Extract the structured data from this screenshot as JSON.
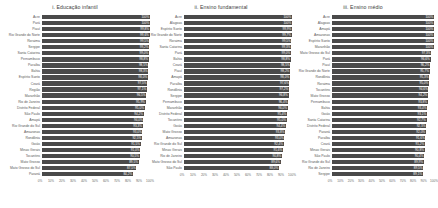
{
  "figure": {
    "background": "#ffffff",
    "bar_color": "#4a4a4a",
    "value_label_color": "#ffffff",
    "axis_text_color": "#6a6a6a"
  },
  "axis": {
    "ticks": [
      "0%",
      "10%",
      "20%",
      "30%",
      "40%",
      "50%",
      "60%",
      "70%",
      "80%",
      "90%",
      "100%"
    ],
    "min": 0,
    "max": 100
  },
  "chart_data": [
    {
      "type": "bar",
      "orientation": "horizontal",
      "title": "i. Educação infantil",
      "xlabel": "",
      "ylabel": "",
      "xlim": [
        0,
        100
      ],
      "grid": false,
      "legend": "none",
      "categories": [
        "Acre",
        "Pará",
        "Piauí",
        "Rio Grande do Norte",
        "Roraima",
        "Sergipe",
        "Santa Catarina",
        "Pernambuco",
        "Paraíba",
        "Bahia",
        "Espírito Santo",
        "Ceará",
        "Região",
        "Maranhão",
        "Rio de Janeiro",
        "Distrito Federal",
        "São Paulo",
        "Amapá",
        "Rio Grande do Sul",
        "Amazonas",
        "Rondônia",
        "Goiás",
        "Minas Gerais",
        "Tocantins",
        "Mato Grosso",
        "Mato Grosso do Sul",
        "Paraná"
      ],
      "values": [
        100.0,
        100.0,
        99.8,
        99.6,
        99.5,
        99.2,
        99.0,
        98.8,
        98.5,
        98.3,
        98.0,
        97.5,
        97.1,
        96.5,
        95.9,
        95.0,
        94.2,
        94.0,
        93.3,
        93.0,
        92.5,
        91.5,
        91.0,
        90.5,
        89.5,
        87.5,
        84.2
      ],
      "value_labels": [
        "100%",
        "100%",
        "99,8%",
        "99,6%",
        "99,5%",
        "99,2%",
        "99,0%",
        "98,8%",
        "98,5%",
        "98,3%",
        "98,0%",
        "97,5%",
        "97,1%",
        "96,5%",
        "95,9%",
        "95,0%",
        "94,2%",
        "94,0%",
        "93,3%",
        "93,0%",
        "92,5%",
        "91,5%",
        "91,0%",
        "90,5%",
        "89,5%",
        "87,5%",
        "84,2%"
      ]
    },
    {
      "type": "bar",
      "orientation": "horizontal",
      "title": "ii. Ensino fundamental",
      "xlabel": "",
      "ylabel": "",
      "xlim": [
        0,
        100
      ],
      "grid": false,
      "legend": "none",
      "categories": [
        "Acre",
        "Alagoas",
        "Espírito Santo",
        "Rio Grande do Norte",
        "Roraima",
        "Santa Catarina",
        "Pará",
        "Bahia",
        "Ceará",
        "Piauí",
        "Amapá",
        "Paraíba",
        "Rondônia",
        "Sergipe",
        "Pernambuco",
        "Maranhão",
        "Distrito Federal",
        "Tocantins",
        "Goiás",
        "Mato Grosso",
        "Amazonas",
        "Rio Grande do Sul",
        "Minas Gerais",
        "Rio de Janeiro",
        "Mato Grosso do Sul",
        "São Paulo"
      ],
      "values": [
        100.0,
        100.0,
        99.9,
        99.7,
        99.5,
        99.3,
        99.0,
        98.8,
        98.5,
        98.2,
        98.0,
        97.6,
        97.2,
        96.8,
        96.4,
        96.0,
        95.4,
        95.0,
        94.4,
        93.8,
        93.0,
        92.4,
        91.6,
        90.8,
        89.6,
        88.0
      ],
      "value_labels": [
        "100%",
        "100%",
        "99,9%",
        "99,7%",
        "99,5%",
        "99,3%",
        "99,0%",
        "98,8%",
        "98,5%",
        "98,2%",
        "98,0%",
        "97,6%",
        "97,2%",
        "96,8%",
        "96,4%",
        "96,0%",
        "95,4%",
        "95,0%",
        "94,4%",
        "93,8%",
        "93,0%",
        "92,4%",
        "91,6%",
        "90,8%",
        "89,6%",
        "88,0%"
      ]
    },
    {
      "type": "bar",
      "orientation": "horizontal",
      "title": "iii. Ensino médio",
      "xlabel": "",
      "ylabel": "",
      "xlim": [
        0,
        100
      ],
      "grid": false,
      "legend": "none",
      "categories": [
        "Acre",
        "Alagoas",
        "Amapá",
        "Amazonas",
        "Espírito Santo",
        "Maranhão",
        "Mato Grosso do Sul",
        "Pará",
        "Piauí",
        "Rio Grande do Norte",
        "Rondônia",
        "Roraima",
        "Tocantins",
        "Mato Grosso",
        "Pernambuco",
        "Bahia",
        "Goiás",
        "Santa Catarina",
        "Distrito Federal",
        "Paraná",
        "Paraíba",
        "Ceará",
        "Minas Gerais",
        "São Paulo",
        "Rio Grande do Sul",
        "Rio de Janeiro",
        "Sergipe"
      ],
      "values": [
        100.0,
        100.0,
        100.0,
        100.0,
        100.0,
        100.0,
        97.3,
        96.6,
        96.2,
        95.7,
        95.3,
        95.0,
        94.6,
        94.2,
        93.8,
        93.4,
        93.1,
        92.7,
        92.3,
        92.0,
        91.6,
        91.2,
        90.8,
        90.4,
        89.9,
        89.5,
        89.1
      ],
      "value_labels": [
        "100%",
        "100%",
        "100%",
        "100%",
        "100%",
        "100%",
        "97,3%",
        "96,6%",
        "96,2%",
        "95,7%",
        "95,3%",
        "95,0%",
        "94,6%",
        "94,2%",
        "93,8%",
        "93,4%",
        "93,1%",
        "92,7%",
        "92,3%",
        "92,0%",
        "91,6%",
        "91,2%",
        "90,8%",
        "90,4%",
        "89,9%",
        "89,5%",
        "89,1%"
      ]
    }
  ]
}
